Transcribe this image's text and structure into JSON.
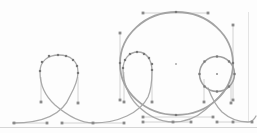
{
  "canvas": {
    "width": 257,
    "height": 133,
    "background": "#fdfdfd"
  },
  "colors": {
    "curve": "#a9a9a9",
    "big_circle": "#a3a3a3",
    "small_circle": "#9e9e9e",
    "handle_line": "#c6c6c6",
    "marker": "#8a8a8a",
    "node": "#787878",
    "rule": "#d6d6d6",
    "page_edge": "#e4e4e4"
  },
  "scene": {
    "rules": [
      {
        "name": "baseline-rule",
        "x1": 0,
        "y1": 127.5,
        "x2": 257,
        "y2": 127.5,
        "color_key": "rule",
        "w": 1
      },
      {
        "name": "page-edge-line",
        "x1": 248.5,
        "y1": 12,
        "x2": 248.5,
        "y2": 122,
        "color_key": "page_edge",
        "w": 1
      }
    ],
    "handles": [
      {
        "x1": 13,
        "y1": 123,
        "x2": 47,
        "y2": 123
      },
      {
        "x1": 62,
        "y1": 123,
        "x2": 124,
        "y2": 123
      },
      {
        "x1": 143,
        "y1": 122,
        "x2": 191,
        "y2": 122
      },
      {
        "x1": 217,
        "y1": 122,
        "x2": 252,
        "y2": 122
      },
      {
        "x1": 143,
        "y1": 13,
        "x2": 208,
        "y2": 13
      },
      {
        "x1": 143,
        "y1": 117,
        "x2": 213,
        "y2": 117
      },
      {
        "x1": 120,
        "y1": 33,
        "x2": 120,
        "y2": 100
      },
      {
        "x1": 233,
        "y1": 25,
        "x2": 233,
        "y2": 100
      },
      {
        "x1": 41,
        "y1": 77,
        "x2": 41,
        "y2": 102
      },
      {
        "x1": 78,
        "y1": 77,
        "x2": 78,
        "y2": 103
      },
      {
        "x1": 124,
        "y1": 72,
        "x2": 124,
        "y2": 102
      },
      {
        "x1": 152,
        "y1": 72,
        "x2": 152,
        "y2": 102
      },
      {
        "x1": 204,
        "y1": 79,
        "x2": 204,
        "y2": 102
      },
      {
        "x1": 231,
        "y1": 79,
        "x2": 231,
        "y2": 103
      }
    ],
    "paths": [
      {
        "name": "spline-curve",
        "color_key": "curve",
        "w": 1.3,
        "d": "M 13 123 C 40 123 62 116 70 96 C 75 87 78 80 78 72 C 78 61 70 55 59 55 C 48 55 40 61 40 72 C 40 82 44 95 55 105 C 68 116 80 123 93 123 C 118 123 140 113 148 97 C 151 90 152 80 152 71 C 152 59 146 52 138 52 C 129 52 123 59 123 70 C 123 81 128 96 137 105 C 149 117 160 122 173 122 C 186 122 196 118 205 110 C 215 101 222 95 226 88 M 208 88 C 211 96 216 106 222 112 C 230 119 240 122 248 122 C 252 122 254 120 256 116"
      }
    ],
    "ellipses": [
      {
        "name": "big-circle",
        "cx": 176.5,
        "cy": 63.5,
        "rx": 56.5,
        "ry": 51.5,
        "color_key": "big_circle",
        "w": 1.8
      },
      {
        "name": "small-circle",
        "cx": 217,
        "cy": 74,
        "rx": 17.5,
        "ry": 17.5,
        "color_key": "small_circle",
        "w": 1.5
      }
    ],
    "markers": [
      {
        "x": 14,
        "y": 123
      },
      {
        "x": 47,
        "y": 123
      },
      {
        "x": 62,
        "y": 123
      },
      {
        "x": 93,
        "y": 123
      },
      {
        "x": 124,
        "y": 123
      },
      {
        "x": 143,
        "y": 122
      },
      {
        "x": 173,
        "y": 122
      },
      {
        "x": 191,
        "y": 122
      },
      {
        "x": 217,
        "y": 122
      },
      {
        "x": 233,
        "y": 122
      },
      {
        "x": 252,
        "y": 122
      },
      {
        "x": 143,
        "y": 13
      },
      {
        "x": 208,
        "y": 13
      },
      {
        "x": 120,
        "y": 33
      },
      {
        "x": 120,
        "y": 100
      },
      {
        "x": 233,
        "y": 25
      },
      {
        "x": 233,
        "y": 100
      },
      {
        "x": 143,
        "y": 117
      },
      {
        "x": 213,
        "y": 117
      },
      {
        "x": 41,
        "y": 102
      },
      {
        "x": 78,
        "y": 103
      },
      {
        "x": 124,
        "y": 102
      },
      {
        "x": 152,
        "y": 102
      },
      {
        "x": 204,
        "y": 102
      },
      {
        "x": 231,
        "y": 103
      }
    ],
    "nodes": [
      {
        "x": 40,
        "y": 71
      },
      {
        "x": 42,
        "y": 62
      },
      {
        "x": 49,
        "y": 56
      },
      {
        "x": 58,
        "y": 55
      },
      {
        "x": 66,
        "y": 56
      },
      {
        "x": 73,
        "y": 60
      },
      {
        "x": 77,
        "y": 66
      },
      {
        "x": 78,
        "y": 73
      },
      {
        "x": 123,
        "y": 68
      },
      {
        "x": 125,
        "y": 60
      },
      {
        "x": 130,
        "y": 54
      },
      {
        "x": 137,
        "y": 52
      },
      {
        "x": 144,
        "y": 54
      },
      {
        "x": 149,
        "y": 58
      },
      {
        "x": 152,
        "y": 64
      },
      {
        "x": 152,
        "y": 70
      },
      {
        "x": 234.5,
        "y": 74
      },
      {
        "x": 229,
        "y": 61.5
      },
      {
        "x": 217,
        "y": 56.5
      },
      {
        "x": 204.5,
        "y": 61.5
      },
      {
        "x": 199.5,
        "y": 74
      },
      {
        "x": 204.5,
        "y": 86.5
      },
      {
        "x": 217,
        "y": 91.5
      },
      {
        "x": 229,
        "y": 86.5
      },
      {
        "x": 176,
        "y": 12
      },
      {
        "x": 120,
        "y": 63
      },
      {
        "x": 233,
        "y": 63
      },
      {
        "x": 176,
        "y": 115
      }
    ],
    "center_marks": [
      {
        "name": "big-circle-center-mark",
        "x": 176,
        "y": 64,
        "color": "#9c9c9c"
      },
      {
        "name": "small-circle-center-mark",
        "x": 217,
        "y": 74,
        "color": "#7a7a7a"
      }
    ]
  }
}
